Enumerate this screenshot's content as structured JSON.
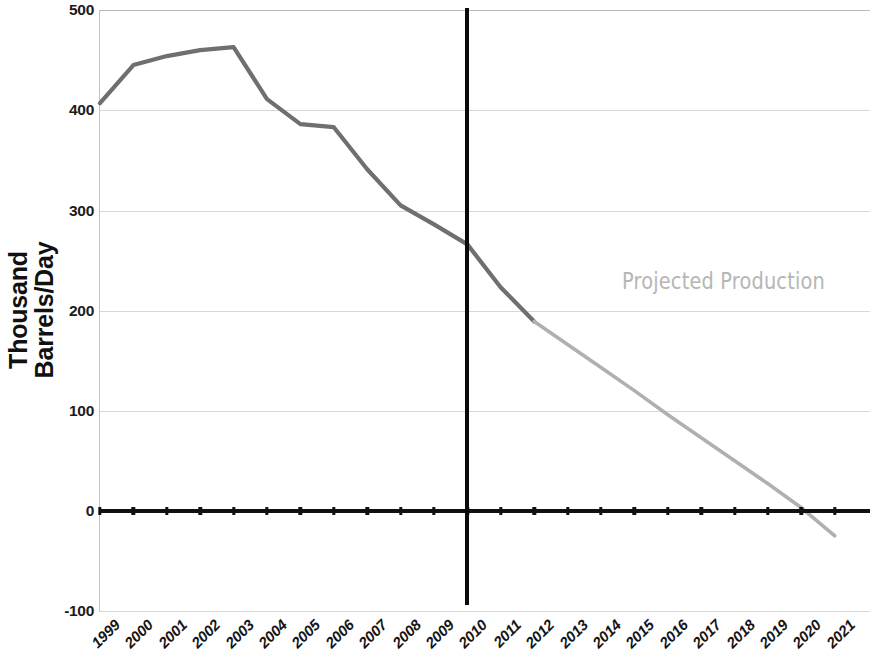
{
  "chart": {
    "ylabel_line1": "Thousand",
    "ylabel_line2": "Barrels/Day",
    "annotation": "Projected Production",
    "divider_year": "2010",
    "colors": {
      "historical_line": "#6f6f6f",
      "projected_line": "#b0b0b0",
      "axis": "#111111",
      "grid": "#d7d7d7",
      "annotation_text": "#b6b6b6",
      "divider": "#0a0a0a"
    }
  },
  "chart_data": {
    "type": "line",
    "title": "",
    "xlabel": "",
    "ylabel": "Thousand Barrels/Day",
    "ylim": [
      -100,
      500
    ],
    "yticks": [
      500,
      400,
      300,
      200,
      100,
      0,
      -100
    ],
    "ytick_labels": [
      "500",
      "400",
      "300",
      "200",
      "100",
      "0",
      "-100"
    ],
    "grid": true,
    "legend": "none",
    "annotations": [
      {
        "text": "Projected Production",
        "x": "2015",
        "y": 240
      },
      {
        "text": "2010",
        "type": "vertical-divider-history-vs-projection"
      }
    ],
    "categories": [
      "1999",
      "2000",
      "2001",
      "2002",
      "2003",
      "2004",
      "2005",
      "2006",
      "2007",
      "2008",
      "2009",
      "2010",
      "2011",
      "2012",
      "2013",
      "2014",
      "2015",
      "2016",
      "2017",
      "2018",
      "2019",
      "2020",
      "2021"
    ],
    "series": [
      {
        "name": "Historical Production",
        "values": [
          407,
          445,
          454,
          460,
          463,
          411,
          386,
          383,
          341,
          305,
          286,
          266,
          223,
          189,
          null,
          null,
          null,
          null,
          null,
          null,
          null,
          null,
          null
        ]
      },
      {
        "name": "Projected Production",
        "values": [
          null,
          null,
          null,
          null,
          null,
          null,
          null,
          null,
          null,
          null,
          null,
          null,
          null,
          189,
          166,
          143,
          120,
          96,
          73,
          50,
          27,
          3,
          -25
        ]
      }
    ]
  },
  "xaxis": {
    "ticks": [
      "1999",
      "2000",
      "2001",
      "2002",
      "2003",
      "2004",
      "2005",
      "2006",
      "2007",
      "2008",
      "2009",
      "2010",
      "2011",
      "2012",
      "2013",
      "2014",
      "2015",
      "2016",
      "2017",
      "2018",
      "2019",
      "2020",
      "2021"
    ]
  }
}
